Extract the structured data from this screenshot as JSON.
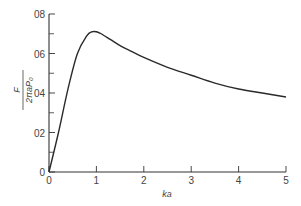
{
  "chart_data": {
    "type": "line",
    "title": "",
    "xlabel": "ka",
    "ylabel": "F / (2πaP₀)",
    "ylabel_parts": {
      "numerator": "F",
      "denominator": "2πaP₀"
    },
    "xlim": [
      0,
      5
    ],
    "ylim": [
      0,
      0.8
    ],
    "xticks": [
      "0",
      "1",
      "2",
      "3",
      "4",
      "5"
    ],
    "yticks": [
      "0",
      "0.2",
      "0.4",
      "0.6",
      "0.8"
    ],
    "ytick_labels_display": [
      "0",
      "02",
      "04",
      "06",
      "08"
    ],
    "grid": false,
    "legend": null,
    "series": [
      {
        "name": "F/(2πaP0)",
        "x": [
          0,
          0.2,
          0.4,
          0.6,
          0.8,
          0.9,
          1.0,
          1.1,
          1.3,
          1.5,
          1.75,
          2.0,
          2.5,
          3.0,
          3.5,
          4.0,
          4.5,
          5.0
        ],
        "y": [
          0,
          0.2,
          0.42,
          0.6,
          0.69,
          0.71,
          0.71,
          0.7,
          0.67,
          0.64,
          0.61,
          0.58,
          0.53,
          0.49,
          0.45,
          0.42,
          0.4,
          0.38
        ]
      }
    ]
  }
}
